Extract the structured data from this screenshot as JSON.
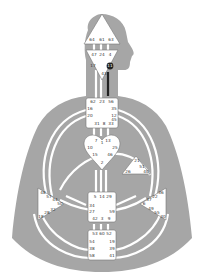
{
  "diagram": {
    "type": "human-design-bodygraph",
    "colors": {
      "silhouette": "#a6a6a6",
      "center_fill": "#ffffff",
      "channel": "#ffffff",
      "defined_channel": "#222222",
      "text": "#333333"
    },
    "centers": {
      "head": {
        "gates": [
          "64",
          "61",
          "63"
        ]
      },
      "ajna": {
        "gates": [
          "47",
          "24",
          "4",
          "17",
          "11",
          "43"
        ]
      },
      "throat": {
        "gates": [
          "62",
          "23",
          "56",
          "16",
          "35",
          "20",
          "12",
          "31",
          "8",
          "33",
          "45"
        ]
      },
      "g": {
        "gates": [
          "7",
          "1",
          "13",
          "10",
          "25",
          "15",
          "46",
          "2"
        ]
      },
      "heart": {
        "gates": [
          "21",
          "51",
          "26",
          "40"
        ]
      },
      "spleen": {
        "gates": [
          "48",
          "57",
          "44",
          "50",
          "32",
          "28",
          "18"
        ]
      },
      "sacral": {
        "gates": [
          "5",
          "14",
          "29",
          "34",
          "27",
          "59",
          "42",
          "3",
          "9"
        ]
      },
      "solar": {
        "gates": [
          "36",
          "22",
          "37",
          "6",
          "49",
          "55",
          "30"
        ]
      },
      "root": {
        "gates": [
          "53",
          "60",
          "52",
          "54",
          "38",
          "58",
          "19",
          "39",
          "41"
        ]
      }
    }
  }
}
